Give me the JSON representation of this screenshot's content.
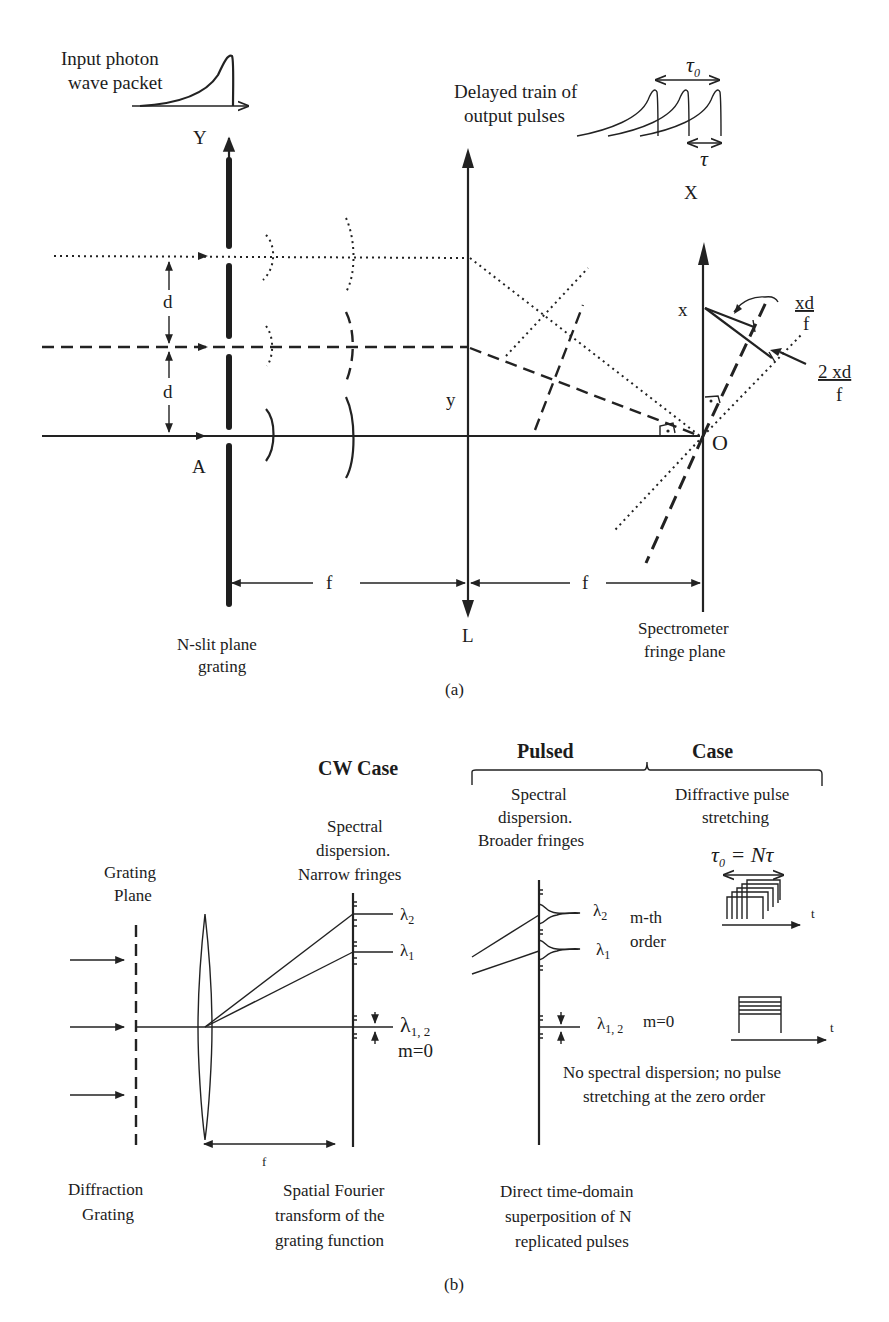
{
  "panel_a": {
    "caption": "(a)",
    "input_label_line1": "Input photon",
    "input_label_line2": "wave packet",
    "output_label_line1": "Delayed train of",
    "output_label_line2": "output pulses",
    "tau0": "τ",
    "tau0_sub": "0",
    "tau": "τ",
    "axis_Y": "Y",
    "axis_X": "X",
    "point_A": "A",
    "point_O": "O",
    "label_d1": "d",
    "label_d2": "d",
    "label_y": "y",
    "label_x": "x",
    "label_L": "L",
    "label_f1": "f",
    "label_f2": "f",
    "frac1_num": "xd",
    "frac1_den": "f",
    "frac2_num": "2 xd",
    "frac2_den": "f",
    "grating_line1": "N-slit plane",
    "grating_line2": "grating",
    "fringe_line1": "Spectrometer",
    "fringe_line2": "fringe plane"
  },
  "panel_b": {
    "caption": "(b)",
    "cw_title": "CW Case",
    "pulsed_title": "Pulsed",
    "case_title": "Case",
    "grating_plane_line1": "Grating",
    "grating_plane_line2": "Plane",
    "cw_desc_line1": "Spectral",
    "cw_desc_line2": "dispersion.",
    "cw_desc_line3": "Narrow fringes",
    "pulsed_desc_line1": "Spectral",
    "pulsed_desc_line2": "dispersion.",
    "pulsed_desc_line3": "Broader fringes",
    "stretch_line1": "Diffractive pulse",
    "stretch_line2": "stretching",
    "tau_eq": "τ",
    "tau_eq_sub": "0",
    "tau_eq_rest": " = Nτ",
    "lambda2": "λ",
    "lambda2_sub": "2",
    "lambda1": "λ",
    "lambda1_sub": "1",
    "lambda12": "λ",
    "lambda12_sub": "1, 2",
    "m0": "m=0",
    "pulsed_lambda2": "λ",
    "pulsed_lambda2_sub": "2",
    "pulsed_lambda1": "λ",
    "pulsed_lambda1_sub": "1",
    "pulsed_lambda12": "λ",
    "pulsed_lambda12_sub": "1, 2",
    "pulsed_m0": "m=0",
    "mth_line1": "m-th",
    "mth_line2": "order",
    "t_axis1": "t",
    "t_axis2": "t",
    "label_f": "f",
    "zero_order_line1": "No spectral dispersion; no pulse",
    "zero_order_line2": "stretching at the zero order",
    "diffraction_line1": "Diffraction",
    "diffraction_line2": "Grating",
    "fourier_line1": "Spatial Fourier",
    "fourier_line2": "transform of the",
    "fourier_line3": "grating function",
    "direct_line1": "Direct time-domain",
    "direct_line2": "superposition of N",
    "direct_line3": "replicated pulses"
  }
}
